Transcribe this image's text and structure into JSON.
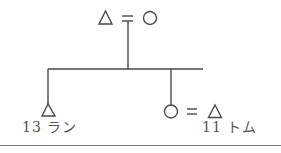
{
  "diagram": {
    "type": "kinship-chart",
    "colors": {
      "line": "#4a4a4a",
      "text": "#555555",
      "rule": "#777777"
    },
    "parents": {
      "father": {
        "symbol": "triangle",
        "meaning": "male"
      },
      "marriage": {
        "symbol": "="
      },
      "mother": {
        "symbol": "circle",
        "meaning": "female"
      }
    },
    "children": [
      {
        "symbol": "triangle",
        "meaning": "male",
        "age": "13",
        "name": "ラン",
        "label": "13 ラン"
      },
      {
        "symbol": "circle",
        "meaning": "female",
        "spouse": {
          "symbol": "triangle",
          "meaning": "male",
          "age": "11",
          "name": "トム"
        },
        "marriage": "="
      }
    ],
    "spouse_label": "11 トム"
  }
}
